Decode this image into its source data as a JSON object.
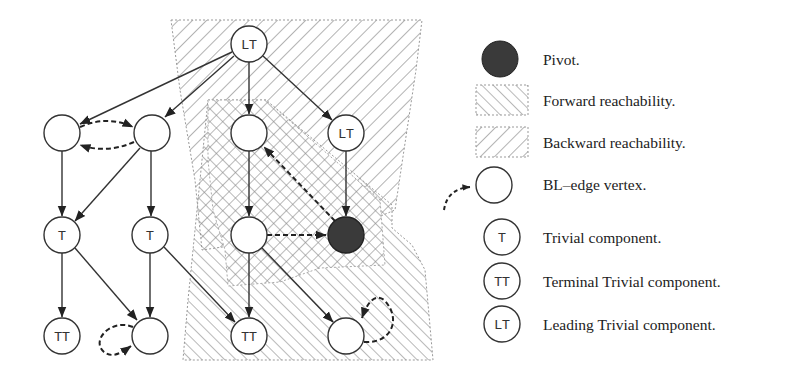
{
  "colors": {
    "stroke": "#333333",
    "pivot_fill": "#3a3a3a",
    "hatch": "#8a8a8a",
    "region_border": "#999999",
    "background": "#ffffff"
  },
  "nodes": [
    {
      "id": "lt_top",
      "label": "LT",
      "kind": "leading-trivial",
      "x": 249,
      "y": 44
    },
    {
      "id": "a",
      "label": "",
      "kind": "bl-edge-vertex",
      "x": 62,
      "y": 133
    },
    {
      "id": "b",
      "label": "",
      "kind": "bl-edge-vertex",
      "x": 152,
      "y": 133
    },
    {
      "id": "c",
      "label": "",
      "kind": "vertex",
      "x": 249,
      "y": 133
    },
    {
      "id": "lt_right",
      "label": "LT",
      "kind": "leading-trivial",
      "x": 346,
      "y": 133
    },
    {
      "id": "t1",
      "label": "T",
      "kind": "trivial",
      "x": 62,
      "y": 235
    },
    {
      "id": "t2",
      "label": "T",
      "kind": "trivial",
      "x": 150,
      "y": 235
    },
    {
      "id": "d",
      "label": "",
      "kind": "vertex",
      "x": 249,
      "y": 235
    },
    {
      "id": "pivot",
      "label": "",
      "kind": "pivot",
      "x": 346,
      "y": 235
    },
    {
      "id": "tt1",
      "label": "TT",
      "kind": "terminal-trivial",
      "x": 62,
      "y": 336
    },
    {
      "id": "e",
      "label": "",
      "kind": "bl-edge-vertex",
      "x": 150,
      "y": 336
    },
    {
      "id": "tt2",
      "label": "TT",
      "kind": "terminal-trivial",
      "x": 249,
      "y": 336
    },
    {
      "id": "f",
      "label": "",
      "kind": "bl-edge-vertex",
      "x": 346,
      "y": 336
    }
  ],
  "edges": [
    {
      "from": "lt_top",
      "to": "a",
      "style": "solid"
    },
    {
      "from": "lt_top",
      "to": "b",
      "style": "solid"
    },
    {
      "from": "lt_top",
      "to": "c",
      "style": "solid"
    },
    {
      "from": "lt_top",
      "to": "lt_right",
      "style": "solid"
    },
    {
      "from": "a",
      "to": "t1",
      "style": "solid"
    },
    {
      "from": "b",
      "to": "t1",
      "style": "solid"
    },
    {
      "from": "b",
      "to": "t2",
      "style": "solid"
    },
    {
      "from": "c",
      "to": "d",
      "style": "solid"
    },
    {
      "from": "lt_right",
      "to": "pivot",
      "style": "solid"
    },
    {
      "from": "t1",
      "to": "tt1",
      "style": "solid"
    },
    {
      "from": "t1",
      "to": "e",
      "style": "solid"
    },
    {
      "from": "t2",
      "to": "e",
      "style": "solid"
    },
    {
      "from": "t2",
      "to": "tt2",
      "style": "solid"
    },
    {
      "from": "d",
      "to": "tt2",
      "style": "solid"
    },
    {
      "from": "d",
      "to": "f",
      "style": "solid"
    },
    {
      "from": "d",
      "to": "pivot",
      "style": "dashed"
    },
    {
      "from": "pivot",
      "to": "c",
      "style": "dashed"
    },
    {
      "from": "a",
      "to": "b",
      "style": "dashed-curve"
    },
    {
      "from": "b",
      "to": "a",
      "style": "dashed-curve"
    },
    {
      "from": "e",
      "to": "e",
      "style": "dashed-self-loop-left"
    },
    {
      "from": "f",
      "to": "f",
      "style": "dashed-self-loop-right"
    }
  ],
  "regions": [
    {
      "name": "backward-reachability",
      "pattern": "backslash-hatch"
    },
    {
      "name": "forward-reachability",
      "pattern": "slash-hatch"
    },
    {
      "name": "intersection",
      "pattern": "cross-hatch"
    }
  ],
  "legend": {
    "items": [
      {
        "icon": "pivot-icon",
        "label": "Pivot."
      },
      {
        "icon": "forward-hatch-icon",
        "label": "Forward reachability."
      },
      {
        "icon": "backward-hatch-icon",
        "label": "Backward reachability."
      },
      {
        "icon": "bl-edge-vertex-icon",
        "label": "BL–edge vertex."
      },
      {
        "icon": "trivial-icon",
        "icon_text": "T",
        "label": "Trivial component."
      },
      {
        "icon": "terminal-trivial-icon",
        "icon_text": "TT",
        "label": "Terminal Trivial component."
      },
      {
        "icon": "leading-trivial-icon",
        "icon_text": "LT",
        "label": "Leading Trivial component."
      }
    ]
  }
}
